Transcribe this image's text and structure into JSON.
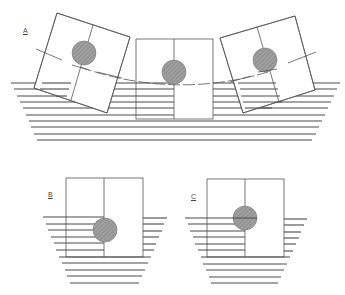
{
  "figure": {
    "panels": [
      {
        "id": "A",
        "label": "A",
        "description": "Floating block heeled left, upright, and heeled right with dashed arc traced by centre of buoyancy"
      },
      {
        "id": "B",
        "label": "B",
        "description": "Upright block with shaded circle displaced right of centre, left half submerged"
      },
      {
        "id": "C",
        "label": "C",
        "description": "Upright block with shaded circle on centreline at waterline"
      }
    ],
    "colors": {
      "line": "#555555",
      "water": "#4a4a4a",
      "circle_fill": "#9a9a9a",
      "background": "#ffffff"
    }
  }
}
